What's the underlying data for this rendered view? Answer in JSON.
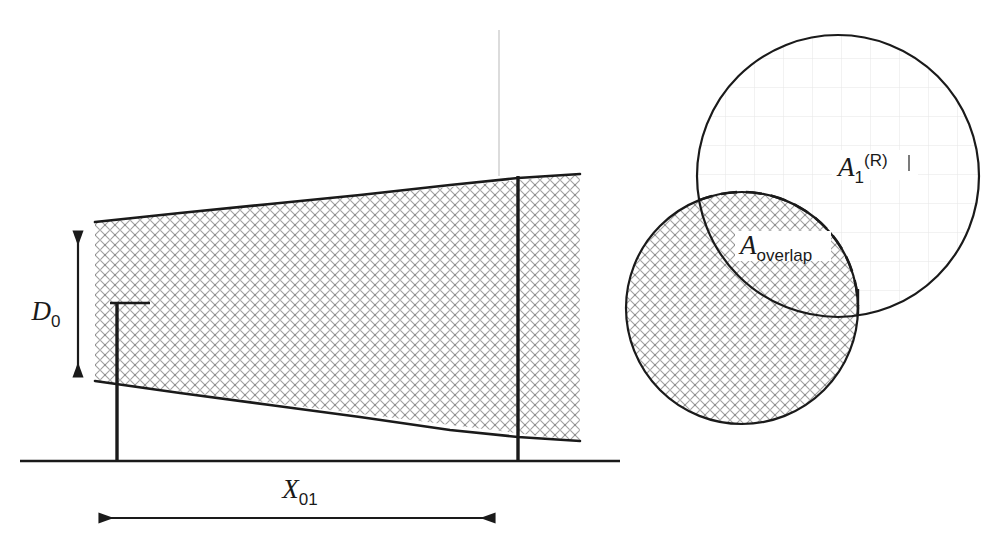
{
  "figure": {
    "background_color": "#ffffff",
    "line_color": "#1a1a1a",
    "hatch_color": "#9a9a9a",
    "faint_line_color": "#d8d8d8"
  },
  "labels": {
    "d0": {
      "base": "D",
      "sub": "0"
    },
    "x01": {
      "base": "X",
      "sub": "01"
    },
    "a1R": {
      "base": "A",
      "sub": "1",
      "sup": "(R)"
    },
    "a_overlap": {
      "base": "A",
      "sub": "overlap"
    },
    "tick_i": "i"
  },
  "geometry": {
    "baseline": {
      "x1": 20,
      "y1": 461,
      "x2": 620,
      "y2": 461
    },
    "wedge": {
      "points": "95,222 580,174 580,441 95,381",
      "description": "hatched trapezoid wedge widening to the right"
    },
    "left_post": {
      "x": 117,
      "y_top": 303,
      "y_bottom": 461
    },
    "left_post_cap": {
      "x1": 110,
      "x2": 148,
      "y": 303
    },
    "right_post": {
      "x": 518,
      "y_top": 176,
      "y_bottom": 461
    },
    "faint_vertical": {
      "x": 499,
      "y_top": 30,
      "y_bottom": 176
    },
    "d0_arrow": {
      "x": 78,
      "y_top": 228,
      "y_bottom": 380
    },
    "x01_arrow": {
      "y": 518,
      "x_left": 96,
      "x_right": 498
    },
    "circle_upper_right": {
      "cx": 838,
      "cy": 176,
      "r": 141
    },
    "circle_lower_left": {
      "cx": 742,
      "cy": 308,
      "r": 116
    },
    "tick_mark_i": {
      "x": 858,
      "y_top": 289,
      "y_bottom": 306
    }
  }
}
